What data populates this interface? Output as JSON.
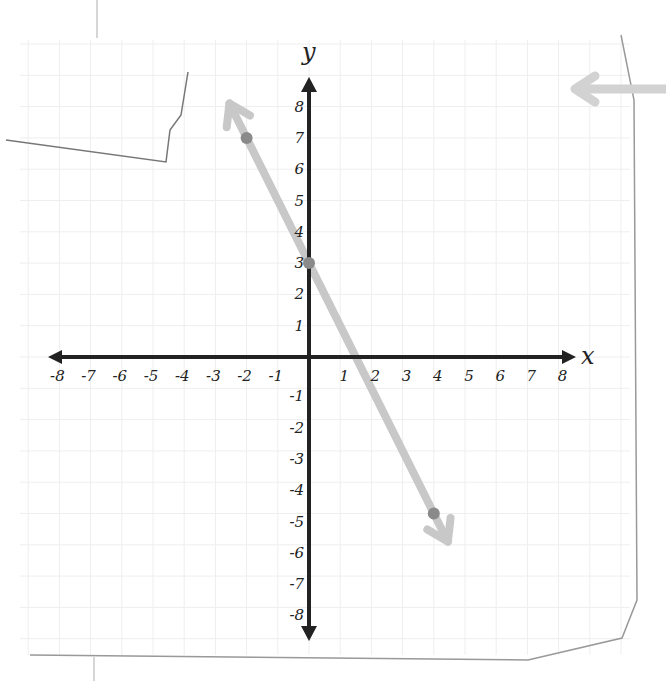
{
  "chart_data": {
    "type": "line",
    "title": "",
    "xlabel": "x",
    "ylabel": "y",
    "xlim": [
      -8,
      8
    ],
    "ylim": [
      -8,
      8
    ],
    "grid": true,
    "x_ticks": [
      "-8",
      "-7",
      "-6",
      "-5",
      "-4",
      "-3",
      "-2",
      "-1",
      "1",
      "2",
      "3",
      "4",
      "5",
      "6",
      "7",
      "8"
    ],
    "y_ticks": [
      "8",
      "7",
      "6",
      "5",
      "4",
      "3",
      "2",
      "1",
      "-1",
      "-2",
      "-3",
      "-4",
      "-5",
      "-6",
      "-7",
      "-8"
    ],
    "series": [
      {
        "name": "line",
        "equation": "y = -2x + 3",
        "slope": -2,
        "intercept": 3,
        "points": [
          {
            "x": -2,
            "y": 7
          },
          {
            "x": 0,
            "y": 3
          },
          {
            "x": 4,
            "y": -5
          }
        ],
        "arrows_both_ends": true
      }
    ],
    "legend": null
  },
  "colors": {
    "axis": "#222222",
    "line": "#c8c8c8",
    "point": "#8a8a8a",
    "grid": "#eeeeee",
    "paper_edge": "#888888",
    "background": "#ffffff"
  },
  "labels": {
    "x_axis": "x",
    "y_axis": "y"
  }
}
